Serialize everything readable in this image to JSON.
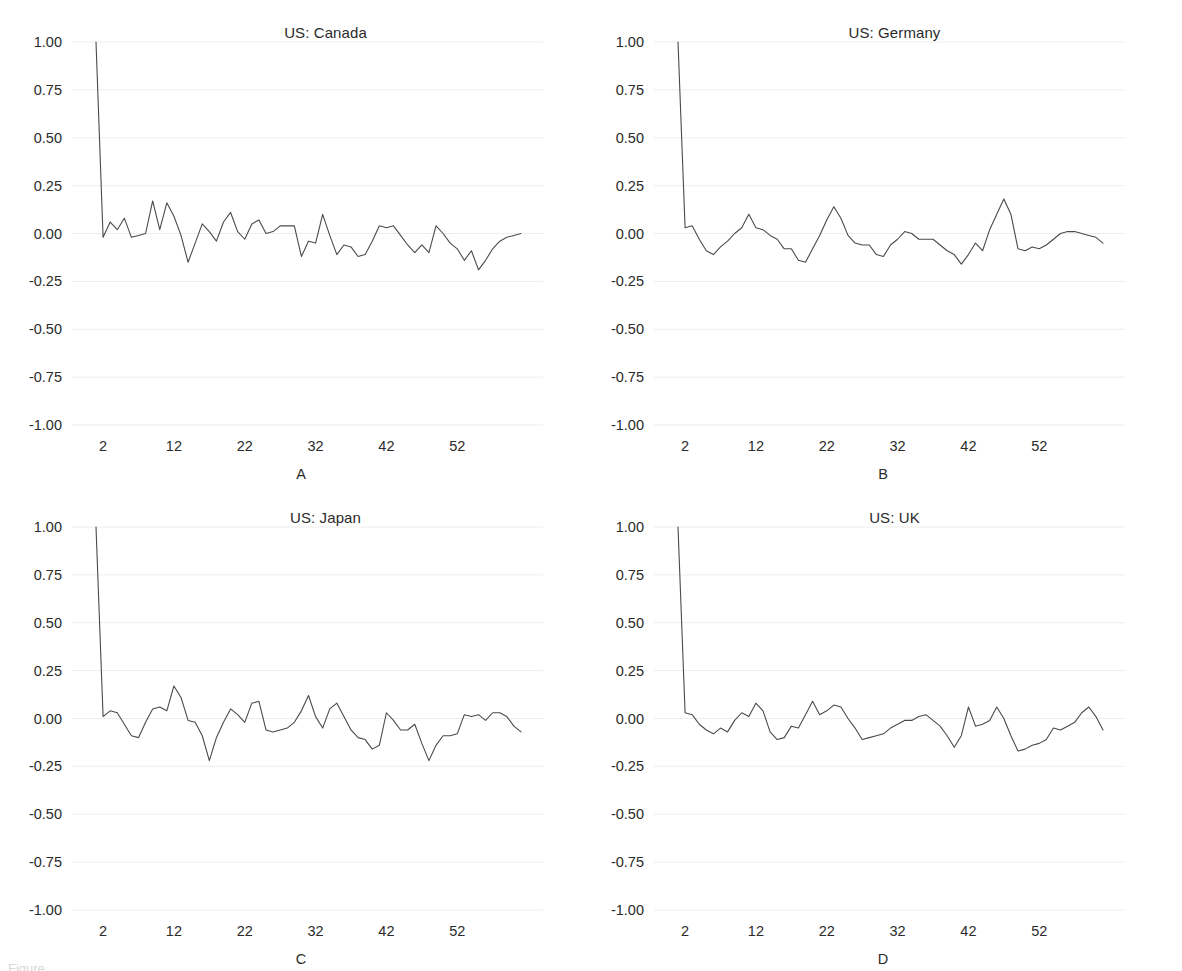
{
  "figure": {
    "caption_fragment": "Figure",
    "panel_order": [
      "A",
      "B",
      "C",
      "D"
    ]
  },
  "axis": {
    "y_ticks": [
      "1.00",
      "0.75",
      "0.50",
      "0.25",
      "0.00",
      "-0.25",
      "-0.50",
      "-0.75",
      "-1.00"
    ],
    "y_tick_values": [
      1.0,
      0.75,
      0.5,
      0.25,
      0.0,
      -0.25,
      -0.5,
      -0.75,
      -1.0
    ],
    "x_ticks": [
      "2",
      "12",
      "22",
      "32",
      "42",
      "52"
    ],
    "x_tick_values": [
      2,
      12,
      22,
      32,
      42,
      52
    ]
  },
  "panels": {
    "a": {
      "title": "US: Canada",
      "letter": "A"
    },
    "b": {
      "title": "US: Germany",
      "letter": "B"
    },
    "c": {
      "title": "US: Japan",
      "letter": "C"
    },
    "d": {
      "title": "US: UK",
      "letter": "D"
    }
  },
  "chart_data": [
    {
      "type": "line",
      "title": "US: Canada",
      "panel": "A",
      "xlabel": "",
      "ylabel": "",
      "xlim": [
        1,
        61
      ],
      "ylim": [
        -1.0,
        1.0
      ],
      "grid": true,
      "legend": "none",
      "x": [
        1,
        2,
        3,
        4,
        5,
        6,
        7,
        8,
        9,
        10,
        11,
        12,
        13,
        14,
        15,
        16,
        17,
        18,
        19,
        20,
        21,
        22,
        23,
        24,
        25,
        26,
        27,
        28,
        29,
        30,
        31,
        32,
        33,
        34,
        35,
        36,
        37,
        38,
        39,
        40,
        41,
        42,
        43,
        44,
        45,
        46,
        47,
        48,
        49,
        50,
        51,
        52,
        53,
        54,
        55,
        56,
        57,
        58,
        59,
        60,
        61
      ],
      "series": [
        {
          "name": "ACF",
          "values": [
            1.0,
            -0.02,
            0.06,
            0.02,
            0.08,
            -0.02,
            -0.01,
            0.0,
            0.17,
            0.02,
            0.16,
            0.09,
            -0.01,
            -0.15,
            -0.05,
            0.05,
            0.01,
            -0.04,
            0.06,
            0.11,
            0.01,
            -0.03,
            0.05,
            0.07,
            0.0,
            0.01,
            0.04,
            0.04,
            0.04,
            -0.12,
            -0.04,
            -0.05,
            0.1,
            -0.01,
            -0.11,
            -0.06,
            -0.07,
            -0.12,
            -0.11,
            -0.04,
            0.04,
            0.03,
            0.04,
            -0.01,
            -0.06,
            -0.1,
            -0.06,
            -0.1,
            0.04,
            0.0,
            -0.05,
            -0.08,
            -0.14,
            -0.09,
            -0.19,
            -0.14,
            -0.08,
            -0.04,
            -0.02,
            -0.01,
            0.0
          ]
        }
      ]
    },
    {
      "type": "line",
      "title": "US: Germany",
      "panel": "B",
      "xlabel": "",
      "ylabel": "",
      "xlim": [
        1,
        61
      ],
      "ylim": [
        -1.0,
        1.0
      ],
      "grid": true,
      "legend": "none",
      "x": [
        1,
        2,
        3,
        4,
        5,
        6,
        7,
        8,
        9,
        10,
        11,
        12,
        13,
        14,
        15,
        16,
        17,
        18,
        19,
        20,
        21,
        22,
        23,
        24,
        25,
        26,
        27,
        28,
        29,
        30,
        31,
        32,
        33,
        34,
        35,
        36,
        37,
        38,
        39,
        40,
        41,
        42,
        43,
        44,
        45,
        46,
        47,
        48,
        49,
        50,
        51,
        52,
        53,
        54,
        55,
        56,
        57,
        58,
        59,
        60,
        61
      ],
      "series": [
        {
          "name": "ACF",
          "values": [
            1.0,
            0.03,
            0.04,
            -0.03,
            -0.09,
            -0.11,
            -0.07,
            -0.04,
            0.0,
            0.03,
            0.1,
            0.03,
            0.02,
            -0.01,
            -0.03,
            -0.08,
            -0.08,
            -0.14,
            -0.15,
            -0.08,
            -0.01,
            0.07,
            0.14,
            0.08,
            -0.01,
            -0.05,
            -0.06,
            -0.06,
            -0.11,
            -0.12,
            -0.06,
            -0.03,
            0.01,
            0.0,
            -0.03,
            -0.03,
            -0.03,
            -0.06,
            -0.09,
            -0.11,
            -0.16,
            -0.11,
            -0.05,
            -0.09,
            0.02,
            0.1,
            0.18,
            0.1,
            -0.08,
            -0.09,
            -0.07,
            -0.08,
            -0.06,
            -0.03,
            0.0,
            0.01,
            0.01,
            0.0,
            -0.01,
            -0.02,
            -0.05
          ]
        }
      ]
    },
    {
      "type": "line",
      "title": "US: Japan",
      "panel": "C",
      "xlabel": "",
      "ylabel": "",
      "xlim": [
        1,
        61
      ],
      "ylim": [
        -1.0,
        1.0
      ],
      "grid": true,
      "legend": "none",
      "x": [
        1,
        2,
        3,
        4,
        5,
        6,
        7,
        8,
        9,
        10,
        11,
        12,
        13,
        14,
        15,
        16,
        17,
        18,
        19,
        20,
        21,
        22,
        23,
        24,
        25,
        26,
        27,
        28,
        29,
        30,
        31,
        32,
        33,
        34,
        35,
        36,
        37,
        38,
        39,
        40,
        41,
        42,
        43,
        44,
        45,
        46,
        47,
        48,
        49,
        50,
        51,
        52,
        53,
        54,
        55,
        56,
        57,
        58,
        59,
        60,
        61
      ],
      "series": [
        {
          "name": "ACF",
          "values": [
            1.0,
            0.01,
            0.04,
            0.03,
            -0.03,
            -0.09,
            -0.1,
            -0.02,
            0.05,
            0.06,
            0.04,
            0.17,
            0.11,
            -0.01,
            -0.02,
            -0.09,
            -0.22,
            -0.1,
            -0.02,
            0.05,
            0.02,
            -0.02,
            0.08,
            0.09,
            -0.06,
            -0.07,
            -0.06,
            -0.05,
            -0.02,
            0.04,
            0.12,
            0.01,
            -0.05,
            0.05,
            0.08,
            0.01,
            -0.06,
            -0.1,
            -0.11,
            -0.16,
            -0.14,
            0.03,
            -0.01,
            -0.06,
            -0.06,
            -0.03,
            -0.13,
            -0.22,
            -0.14,
            -0.09,
            -0.09,
            -0.08,
            0.02,
            0.01,
            0.02,
            -0.01,
            0.03,
            0.03,
            0.01,
            -0.04,
            -0.07
          ]
        }
      ]
    },
    {
      "type": "line",
      "title": "US: UK",
      "panel": "D",
      "xlabel": "",
      "ylabel": "",
      "xlim": [
        1,
        61
      ],
      "ylim": [
        -1.0,
        1.0
      ],
      "grid": true,
      "legend": "none",
      "x": [
        1,
        2,
        3,
        4,
        5,
        6,
        7,
        8,
        9,
        10,
        11,
        12,
        13,
        14,
        15,
        16,
        17,
        18,
        19,
        20,
        21,
        22,
        23,
        24,
        25,
        26,
        27,
        28,
        29,
        30,
        31,
        32,
        33,
        34,
        35,
        36,
        37,
        38,
        39,
        40,
        41,
        42,
        43,
        44,
        45,
        46,
        47,
        48,
        49,
        50,
        51,
        52,
        53,
        54,
        55,
        56,
        57,
        58,
        59,
        60,
        61
      ],
      "series": [
        {
          "name": "ACF",
          "values": [
            1.0,
            0.03,
            0.02,
            -0.03,
            -0.06,
            -0.08,
            -0.05,
            -0.07,
            -0.01,
            0.03,
            0.01,
            0.08,
            0.04,
            -0.07,
            -0.11,
            -0.1,
            -0.04,
            -0.05,
            0.02,
            0.09,
            0.02,
            0.04,
            0.07,
            0.06,
            0.0,
            -0.05,
            -0.11,
            -0.1,
            -0.09,
            -0.08,
            -0.05,
            -0.03,
            -0.01,
            -0.01,
            0.01,
            0.02,
            -0.01,
            -0.04,
            -0.09,
            -0.15,
            -0.09,
            0.06,
            -0.04,
            -0.03,
            -0.01,
            0.06,
            0.0,
            -0.09,
            -0.17,
            -0.16,
            -0.14,
            -0.13,
            -0.11,
            -0.05,
            -0.06,
            -0.04,
            -0.02,
            0.03,
            0.06,
            0.01,
            -0.06
          ]
        }
      ]
    }
  ]
}
